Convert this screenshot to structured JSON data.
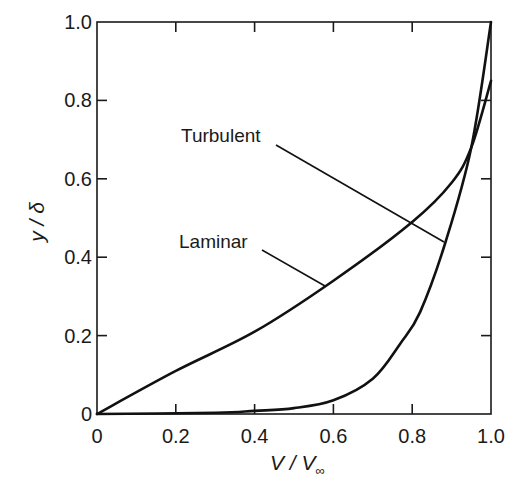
{
  "chart_data": {
    "type": "line",
    "title": "",
    "xlabel": "V / V∞",
    "ylabel": "y / δ",
    "xlim": [
      0,
      1.0
    ],
    "ylim": [
      0,
      1.0
    ],
    "grid": false,
    "legend": "none (curves labeled with leader-line annotations)",
    "x_ticks": [
      "0",
      "0.2",
      "0.4",
      "0.6",
      "0.8",
      "1.0"
    ],
    "y_ticks": [
      "0",
      "0.2",
      "0.4",
      "0.6",
      "0.8",
      "1.0"
    ],
    "series": [
      {
        "name": "Laminar",
        "x": [
          0,
          0.2,
          0.4,
          0.6,
          0.8,
          0.9,
          0.95,
          1.0
        ],
        "y": [
          0,
          0.11,
          0.21,
          0.34,
          0.49,
          0.59,
          0.68,
          0.85
        ]
      },
      {
        "name": "Turbulent",
        "x": [
          0,
          0.3,
          0.4,
          0.5,
          0.6,
          0.7,
          0.77,
          0.82,
          0.885,
          0.95,
          1.0
        ],
        "y": [
          0,
          0.003,
          0.008,
          0.015,
          0.035,
          0.09,
          0.18,
          0.26,
          0.44,
          0.68,
          1.0
        ]
      }
    ],
    "annotations": [
      {
        "text": "Turbulent",
        "points_to": [
          0.885,
          0.44
        ]
      },
      {
        "text": "Laminar",
        "points_to": [
          0.58,
          0.33
        ]
      }
    ]
  },
  "labels": {
    "xlabel_main": "V / V",
    "xlabel_sub": "∞",
    "ylabel": "y / δ",
    "annot_turbulent": "Turbulent",
    "annot_laminar": "Laminar",
    "xticks": [
      "0",
      "0.2",
      "0.4",
      "0.6",
      "0.8",
      "1.0"
    ],
    "yticks": [
      "0",
      "0.2",
      "0.4",
      "0.6",
      "0.8",
      "1.0"
    ]
  }
}
